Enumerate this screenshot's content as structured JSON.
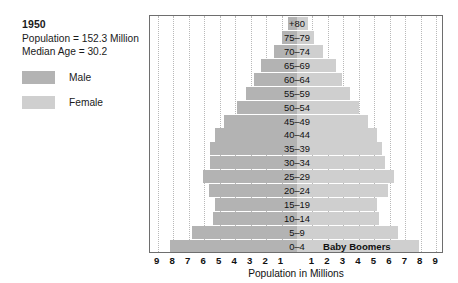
{
  "info": {
    "year": "1950",
    "population_line": "Population = 152.3 Million",
    "median_age_line": "Median Age = 30.2"
  },
  "legend": {
    "items": [
      {
        "label": "Male",
        "color": "#b3b3b3"
      },
      {
        "label": "Female",
        "color": "#cfcfcf"
      }
    ]
  },
  "annotation": {
    "baby_boomers": "Baby Boomers"
  },
  "colors": {
    "male": "#b3b3b3",
    "female": "#cfcfcf",
    "frame": "#6e6e6e",
    "gridline": "#b9b9b9",
    "background": "#ffffff"
  },
  "chart_data": {
    "type": "bar",
    "subtype": "population-pyramid",
    "title": "",
    "xlabel": "Population in Millions",
    "ylabel": "",
    "xlim": [
      -9.5,
      9.5
    ],
    "grid": true,
    "legend_position": "left-outside",
    "x_tick_labels": [
      "9",
      "8",
      "7",
      "6",
      "5",
      "4",
      "3",
      "2",
      "1",
      "1",
      "2",
      "3",
      "4",
      "5",
      "6",
      "7",
      "8",
      "9"
    ],
    "x_tick_values": [
      -9,
      -8,
      -7,
      -6,
      -5,
      -4,
      -3,
      -2,
      -1,
      1,
      2,
      3,
      4,
      5,
      6,
      7,
      8,
      9
    ],
    "categories": [
      "+80",
      "75–79",
      "70–74",
      "65–69",
      "60–64",
      "55–59",
      "50–54",
      "45–49",
      "40–44",
      "35–39",
      "30–34",
      "25–29",
      "20–24",
      "15–19",
      "10–14",
      "5–9",
      "0–4"
    ],
    "series": [
      {
        "name": "Male",
        "color": "#b3b3b3",
        "values": [
          0.6,
          1.0,
          1.5,
          2.3,
          2.8,
          3.3,
          3.9,
          4.7,
          5.3,
          5.6,
          5.6,
          6.1,
          5.7,
          5.3,
          5.4,
          6.8,
          8.2
        ]
      },
      {
        "name": "Female",
        "color": "#cfcfcf",
        "values": [
          0.7,
          1.1,
          1.7,
          2.5,
          2.9,
          3.4,
          4.0,
          4.6,
          5.2,
          5.5,
          5.7,
          6.3,
          5.9,
          5.2,
          5.3,
          6.5,
          7.9
        ]
      }
    ],
    "annotations": [
      {
        "text": "Baby Boomers",
        "category": "0–4",
        "side": "right"
      }
    ]
  }
}
